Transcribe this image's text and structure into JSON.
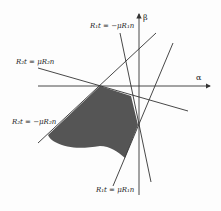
{
  "diagram": {
    "axes": {
      "x_label": "α",
      "y_label": "β"
    },
    "lines": [
      {
        "id": "r1t-neg",
        "label": "R₁t = −μR₁n"
      },
      {
        "id": "r2t-pos",
        "label": "R₂t = μR₂n"
      },
      {
        "id": "r2t-neg",
        "label": "R₂t = −μR₂n"
      },
      {
        "id": "r1t-pos",
        "label": "R₁t = μR₁n"
      }
    ],
    "region": {
      "description": "shaded feasible region",
      "fill": "#555555"
    },
    "colors": {
      "line": "#333333",
      "fill": "#555555",
      "background": "#fdfdfd"
    }
  }
}
